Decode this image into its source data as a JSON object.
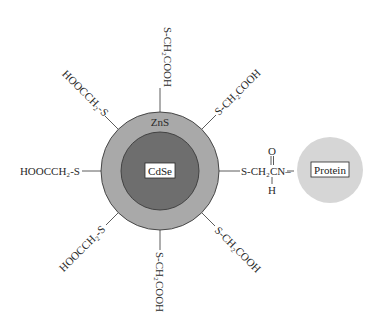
{
  "diagram": {
    "type": "quantum-dot-bioconjugate",
    "core": {
      "label": "CdSe",
      "color": "#6e6e6e"
    },
    "shell": {
      "label": "ZnS",
      "color": "#a9a9a9"
    },
    "protein": {
      "label": "Protein",
      "color": "#d6d6d6"
    },
    "ligands": {
      "top": "S-CH₂COOH",
      "top_right": "S-CH₂COOH",
      "right_link": "S-CH₂CN–",
      "right_link_carbonyl_o": "O",
      "right_link_amide_h": "H",
      "bottom_right": "S-CH₂COOH",
      "bottom": "S-CH₂COOH",
      "bottom_left": "HOOCCH₂-S",
      "left": "HOOCCH₂-S",
      "top_left": "HOOCCH₂-S"
    }
  }
}
